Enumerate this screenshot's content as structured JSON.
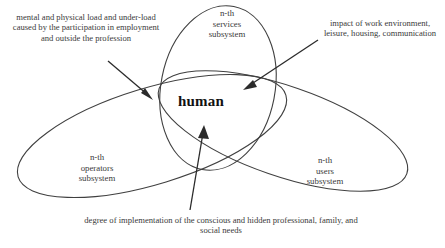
{
  "diagram": {
    "type": "venn-ellipses",
    "background_color": "#ffffff",
    "line_color": "#404040",
    "text_color": "#3a3a3a",
    "center_text_color": "#111111",
    "center": {
      "label": "human"
    },
    "sets": [
      {
        "id": "services",
        "label": "n-th\nservices\nsubsystem",
        "position": "top-center"
      },
      {
        "id": "operators",
        "label": "n-th\noperators\nsubsystem",
        "position": "bottom-left"
      },
      {
        "id": "users",
        "label": "n-th\nusers\nsubsystem",
        "position": "bottom-right"
      }
    ],
    "annotations": [
      {
        "id": "mental-load",
        "text": "mental and physical load and under-load caused by the participation in employment and outside the profession",
        "position": "top-left",
        "arrow": "points-down-right-to-center"
      },
      {
        "id": "work-impact",
        "text": "impact of work environment, leisure, housing, communication",
        "position": "top-right",
        "arrow": "points-down-left-to-center"
      },
      {
        "id": "needs-degree",
        "text": "degree of implementation of the conscious and hidden professional, family,  and social needs",
        "position": "bottom-center",
        "arrow": "points-up-to-center"
      }
    ]
  }
}
